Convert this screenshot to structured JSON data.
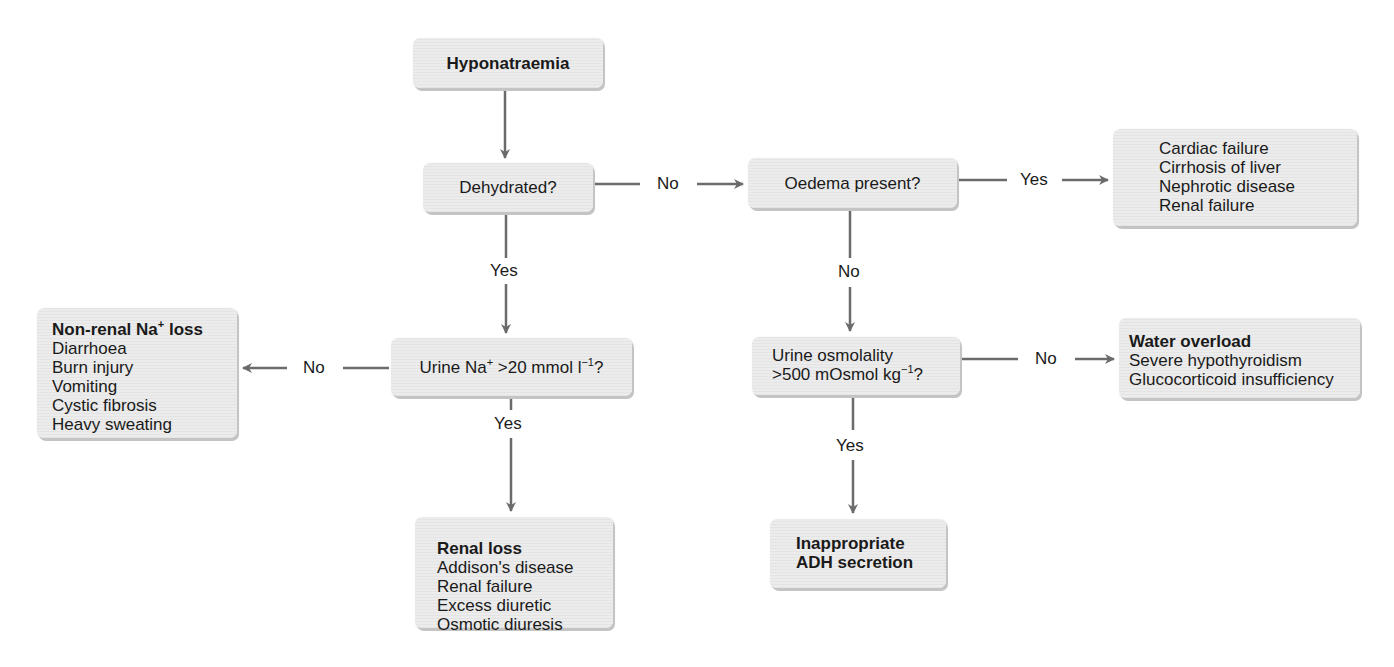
{
  "nodes": {
    "start": {
      "title": "Hyponatraemia"
    },
    "dehydrated": {
      "question": "Dehydrated?"
    },
    "oedema": {
      "question": "Oedema present?"
    },
    "oedema_causes": {
      "items": [
        "Cardiac failure",
        "Cirrhosis of liver",
        "Nephrotic disease",
        "Renal failure"
      ]
    },
    "urine_na": {
      "question_prefix": "Urine Na",
      "question_sup": "+",
      "question_mid": " >20 mmol l",
      "question_sup2": "−1",
      "question_suffix": "?"
    },
    "non_renal": {
      "title_prefix": "Non-renal Na",
      "title_sup": "+",
      "title_suffix": " loss",
      "items": [
        "Diarrhoea",
        "Burn injury",
        "Vomiting",
        "Cystic fibrosis",
        "Heavy sweating"
      ]
    },
    "renal_loss": {
      "title": "Renal loss",
      "items": [
        "Addison's disease",
        "Renal failure",
        "Excess diuretic",
        "Osmotic diuresis"
      ]
    },
    "urine_osm": {
      "line1": "Urine osmolality",
      "line2_prefix": ">500 mOsmol kg",
      "line2_sup": "−1",
      "line2_suffix": "?"
    },
    "water_overload": {
      "title": "Water overload",
      "items": [
        "Severe hypothyroidism",
        "Glucocorticoid insufficiency"
      ]
    },
    "adh": {
      "line1": "Inappropriate",
      "line2": "ADH secretion"
    }
  },
  "edges": {
    "dehydrated_no": "No",
    "dehydrated_yes": "Yes",
    "oedema_yes": "Yes",
    "oedema_no": "No",
    "urine_na_no": "No",
    "urine_na_yes": "Yes",
    "urine_osm_no": "No",
    "urine_osm_yes": "Yes"
  },
  "colors": {
    "arrow": "#6b6b6b",
    "box": "#e8e8e8",
    "text": "#1a1a1a"
  }
}
